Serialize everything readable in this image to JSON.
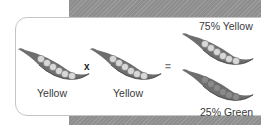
{
  "diagram": {
    "parents": [
      {
        "label": "Yellow",
        "pea_color": "yellow"
      },
      {
        "label": "Yellow",
        "pea_color": "yellow"
      }
    ],
    "operators": {
      "cross": "x",
      "equals": "="
    },
    "offspring": [
      {
        "label": "75% Yellow",
        "pea_color": "yellow"
      },
      {
        "label": "25% Green",
        "pea_color": "green"
      }
    ]
  },
  "colors": {
    "background_hatch": "#8e8e8e",
    "card_border": "#c4c4c4",
    "pod": "#6e6e6e",
    "yellow_pea": "#d8d8d8",
    "green_pea": "#8a8a8a",
    "text": "#3a3a3a"
  }
}
